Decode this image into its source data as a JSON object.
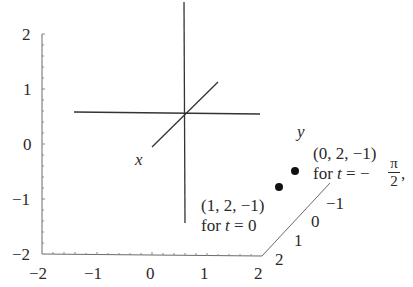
{
  "diagram": {
    "type": "3d-axes-plot",
    "vertical_axis": {
      "ticks": [
        "2",
        "1",
        "0",
        "−1",
        "−2"
      ]
    },
    "horizontal_axis": {
      "ticks": [
        "−2",
        "−1",
        "0",
        "1",
        "2"
      ]
    },
    "depth_axis": {
      "ticks": [
        "2",
        "1",
        "0",
        "−1"
      ]
    },
    "axis_labels": {
      "x": "x",
      "y": "y"
    },
    "points": [
      {
        "coords": "(1, 2, −1)",
        "condition_prefix": "for ",
        "condition_var": "t",
        "condition_rest": " = 0"
      },
      {
        "coords": "(0, 2, −1)",
        "condition_prefix": "for ",
        "condition_var": "t",
        "condition_rest": " = −",
        "fraction_numerator": "π",
        "fraction_denominator": "2",
        "trailing": ","
      }
    ],
    "colors": {
      "axis": "#555555",
      "cross_lines": "#333333",
      "points": "#111111",
      "text": "#2a2a2a"
    }
  }
}
